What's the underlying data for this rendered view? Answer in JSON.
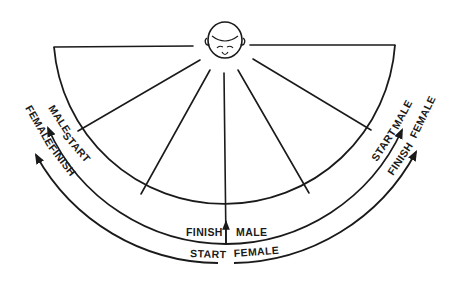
{
  "diagram": {
    "type": "visual-field sweep diagram",
    "figure": {
      "label": "head (top view)",
      "icon": "head-icon"
    },
    "sectors": 6,
    "labels": {
      "left_inner": {
        "male": "MALE",
        "start": "START"
      },
      "left_outer": {
        "female": "FEMALE",
        "finish": "FINISH"
      },
      "right_inner": {
        "start": "START",
        "male": "MALE"
      },
      "right_outer": {
        "finish": "FINISH",
        "female": "FEMALE"
      },
      "bottom_inner": {
        "finish": "FINISH",
        "male": "MALE"
      },
      "bottom_outer": {
        "start": "START",
        "female": "FEMALE"
      }
    },
    "paths": [
      {
        "name": "male",
        "from": "left (START)",
        "to": "bottom-center / right (FINISH)",
        "arc": "inner"
      },
      {
        "name": "female",
        "from": "bottom-center (START)",
        "to": "left and right ends (FINISH)",
        "arc": "outer"
      }
    ]
  }
}
